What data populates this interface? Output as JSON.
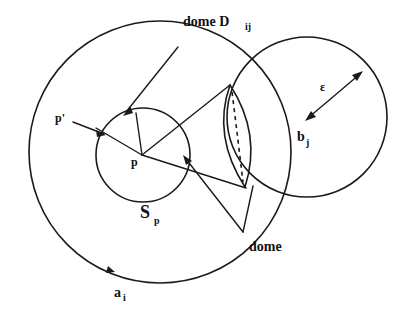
{
  "figure": {
    "background_color": "#ffffff",
    "ink_color": "#1a1a1a",
    "labels": {
      "dome_dij_text": "dome D",
      "dome_dij_sub": "ij",
      "p_prime": "p'",
      "p": "p",
      "s_text": "S",
      "s_sub": "p",
      "a_text": "a",
      "a_sub": "i",
      "b_text": "b",
      "b_sub": "j",
      "epsilon": "ε",
      "dome": "dome"
    },
    "shapes": {
      "big_circle": {
        "name": "sphere-a-i",
        "cx": 160,
        "cy": 152,
        "r": 131
      },
      "right_circle": {
        "name": "sphere-b-j",
        "cx": 307,
        "cy": 117,
        "r": 80
      },
      "small_circle": {
        "name": "sphere-s-p",
        "cx": 143,
        "cy": 155,
        "r": 47
      }
    },
    "points": {
      "p": {
        "x": 142,
        "y": 155
      },
      "p_prime_target": {
        "x": 104,
        "y": 133
      },
      "lens_top": {
        "x": 230,
        "y": 85
      },
      "lens_bottom": {
        "x": 245,
        "y": 187
      },
      "b_j": {
        "x": 307,
        "y": 117
      },
      "epsilon_tip": {
        "x": 362,
        "y": 72
      }
    }
  }
}
